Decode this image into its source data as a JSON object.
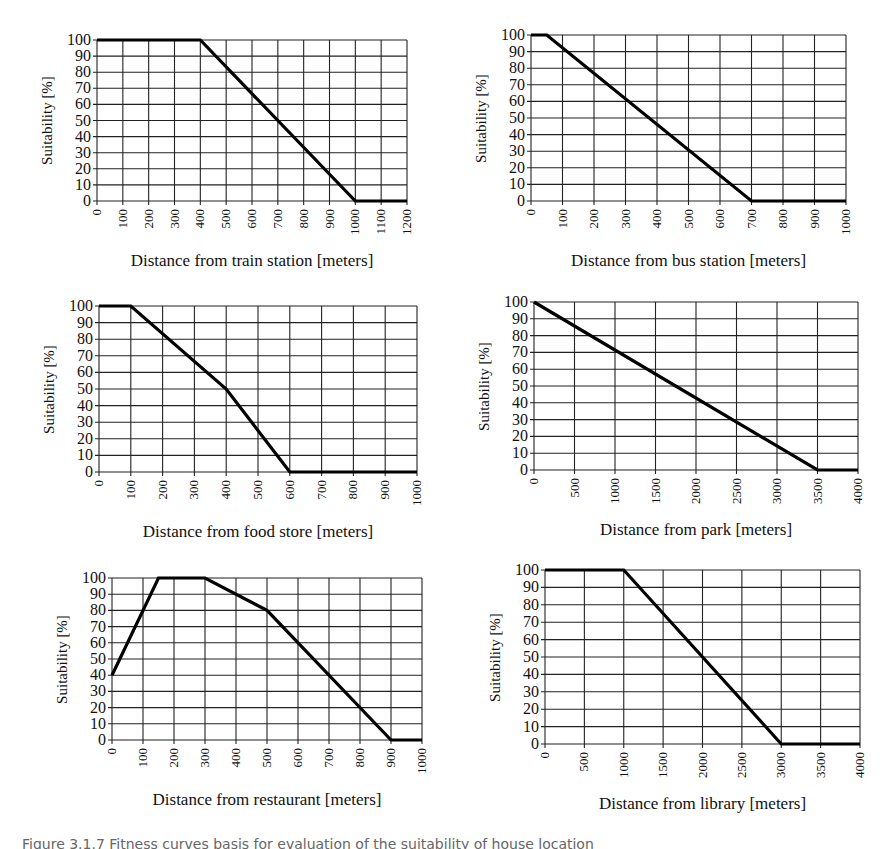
{
  "figure": {
    "caption": "Figure 3.1.7 Fitness curves basis for evaluation of the suitability of house location"
  },
  "chart_data": [
    {
      "id": "train",
      "type": "line",
      "title": "",
      "xlabel": "Distance from train station [meters]",
      "ylabel": "Suitability [%]",
      "x_ticks": [
        0,
        100,
        200,
        300,
        400,
        500,
        600,
        700,
        800,
        900,
        1000,
        1100,
        1200
      ],
      "y_ticks": [
        0,
        10,
        20,
        30,
        40,
        50,
        60,
        70,
        80,
        90,
        100
      ],
      "xlim": [
        0,
        1200
      ],
      "ylim": [
        0,
        100
      ],
      "grid": true,
      "legend": "none",
      "series": [
        {
          "name": "Suitability",
          "x": [
            0,
            400,
            1000,
            1200
          ],
          "y": [
            100,
            100,
            0,
            0
          ]
        }
      ],
      "box": {
        "left": 97,
        "top": 40,
        "right": 407,
        "bottom": 201
      }
    },
    {
      "id": "bus",
      "type": "line",
      "title": "",
      "xlabel": "Distance from bus station [meters]",
      "ylabel": "Suitability [%]",
      "x_ticks": [
        0,
        100,
        200,
        300,
        400,
        500,
        600,
        700,
        800,
        900,
        1000
      ],
      "y_ticks": [
        0,
        10,
        20,
        30,
        40,
        50,
        60,
        70,
        80,
        90,
        100
      ],
      "xlim": [
        0,
        1000
      ],
      "ylim": [
        0,
        100
      ],
      "grid": true,
      "legend": "none",
      "series": [
        {
          "name": "Suitability",
          "x": [
            0,
            50,
            700,
            1000
          ],
          "y": [
            100,
            100,
            0,
            0
          ]
        }
      ],
      "box": {
        "left": 531,
        "top": 35,
        "right": 846,
        "bottom": 201
      }
    },
    {
      "id": "food",
      "type": "line",
      "title": "",
      "xlabel": "Distance from food store [meters]",
      "ylabel": "Suitability [%]",
      "x_ticks": [
        0,
        100,
        200,
        300,
        400,
        500,
        600,
        700,
        800,
        900,
        1000
      ],
      "y_ticks": [
        0,
        10,
        20,
        30,
        40,
        50,
        60,
        70,
        80,
        90,
        100
      ],
      "xlim": [
        0,
        1000
      ],
      "ylim": [
        0,
        100
      ],
      "grid": true,
      "legend": "none",
      "series": [
        {
          "name": "Suitability",
          "x": [
            0,
            100,
            400,
            600,
            1000
          ],
          "y": [
            100,
            100,
            50,
            0,
            0
          ]
        }
      ],
      "box": {
        "left": 99,
        "top": 306,
        "right": 417,
        "bottom": 472
      }
    },
    {
      "id": "park",
      "type": "line",
      "title": "",
      "xlabel": "Distance from park [meters]",
      "ylabel": "Suitability [%]",
      "x_ticks": [
        0,
        500,
        1000,
        1500,
        2000,
        2500,
        3000,
        3500,
        4000
      ],
      "y_ticks": [
        0,
        10,
        20,
        30,
        40,
        50,
        60,
        70,
        80,
        90,
        100
      ],
      "xlim": [
        0,
        4000
      ],
      "ylim": [
        0,
        100
      ],
      "grid": true,
      "legend": "none",
      "series": [
        {
          "name": "Suitability",
          "x": [
            0,
            3500,
            4000
          ],
          "y": [
            100,
            0,
            0
          ]
        }
      ],
      "box": {
        "left": 534,
        "top": 302,
        "right": 858,
        "bottom": 470
      }
    },
    {
      "id": "restaurant",
      "type": "line",
      "title": "",
      "xlabel": "Distance from restaurant [meters]",
      "ylabel": "Suitability [%]",
      "x_ticks": [
        0,
        100,
        200,
        300,
        400,
        500,
        600,
        700,
        800,
        900,
        1000
      ],
      "y_ticks": [
        0,
        10,
        20,
        30,
        40,
        50,
        60,
        70,
        80,
        90,
        100
      ],
      "xlim": [
        0,
        1000
      ],
      "ylim": [
        0,
        100
      ],
      "grid": true,
      "legend": "none",
      "series": [
        {
          "name": "Suitability",
          "x": [
            0,
            150,
            300,
            500,
            900,
            1000
          ],
          "y": [
            40,
            100,
            100,
            80,
            0,
            0
          ]
        }
      ],
      "box": {
        "left": 112,
        "top": 578,
        "right": 422,
        "bottom": 740
      }
    },
    {
      "id": "library",
      "type": "line",
      "title": "",
      "xlabel": "Distance from library [meters]",
      "ylabel": "Suitability [%]",
      "x_ticks": [
        0,
        500,
        1000,
        1500,
        2000,
        2500,
        3000,
        3500,
        4000
      ],
      "y_ticks": [
        0,
        10,
        20,
        30,
        40,
        50,
        60,
        70,
        80,
        90,
        100
      ],
      "xlim": [
        0,
        4000
      ],
      "ylim": [
        0,
        100
      ],
      "grid": true,
      "legend": "none",
      "series": [
        {
          "name": "Suitability",
          "x": [
            0,
            1000,
            3000,
            4000
          ],
          "y": [
            100,
            100,
            0,
            0
          ]
        }
      ],
      "box": {
        "left": 545,
        "top": 570,
        "right": 860,
        "bottom": 744
      }
    }
  ]
}
